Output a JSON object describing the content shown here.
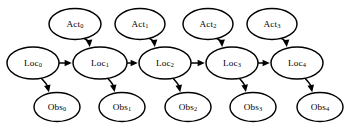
{
  "diagram": {
    "background_color": "#ffffff",
    "stroke_color": "#000000",
    "node_fill": "#ffffff",
    "nodes": {
      "act": [
        {
          "id": "act0",
          "base": "Act",
          "sub": "0",
          "cx": 75,
          "cy": 24,
          "rx": 26,
          "ry": 15.5
        },
        {
          "id": "act1",
          "base": "Act",
          "sub": "1",
          "cx": 140,
          "cy": 24,
          "rx": 25,
          "ry": 15.5
        },
        {
          "id": "act2",
          "base": "Act",
          "sub": "2",
          "cx": 208,
          "cy": 24,
          "rx": 25,
          "ry": 15.5
        },
        {
          "id": "act3",
          "base": "Act",
          "sub": "3",
          "cx": 272,
          "cy": 24,
          "rx": 25,
          "ry": 15.5
        }
      ],
      "loc": [
        {
          "id": "loc0",
          "base": "Loc",
          "sub": "0",
          "cx": 33,
          "cy": 63,
          "rx": 26,
          "ry": 16
        },
        {
          "id": "loc1",
          "base": "Loc",
          "sub": "1",
          "cx": 100,
          "cy": 63,
          "rx": 27,
          "ry": 16
        },
        {
          "id": "loc2",
          "base": "Loc",
          "sub": "2",
          "cx": 165,
          "cy": 63,
          "rx": 26,
          "ry": 16
        },
        {
          "id": "loc3",
          "base": "Loc",
          "sub": "3",
          "cx": 232,
          "cy": 63,
          "rx": 26,
          "ry": 16
        },
        {
          "id": "loc4",
          "base": "Loc",
          "sub": "4",
          "cx": 297,
          "cy": 63,
          "rx": 26,
          "ry": 16
        }
      ],
      "obs": [
        {
          "id": "obs0",
          "base": "Obs",
          "sub": "0",
          "cx": 57,
          "cy": 107,
          "rx": 23,
          "ry": 14.5
        },
        {
          "id": "obs1",
          "base": "Obs",
          "sub": "1",
          "cx": 122,
          "cy": 107,
          "rx": 23,
          "ry": 14.5
        },
        {
          "id": "obs2",
          "base": "Obs",
          "sub": "2",
          "cx": 188,
          "cy": 107,
          "rx": 23,
          "ry": 14.5
        },
        {
          "id": "obs3",
          "base": "Obs",
          "sub": "3",
          "cx": 253,
          "cy": 107,
          "rx": 23,
          "ry": 14.5
        },
        {
          "id": "obs4",
          "base": "Obs",
          "sub": "4",
          "cx": 320,
          "cy": 107,
          "rx": 23,
          "ry": 14.5
        }
      ]
    },
    "edges": [
      {
        "from": "loc0",
        "to": "loc1",
        "kind": "chain"
      },
      {
        "from": "loc1",
        "to": "loc2",
        "kind": "chain"
      },
      {
        "from": "loc2",
        "to": "loc3",
        "kind": "chain"
      },
      {
        "from": "loc3",
        "to": "loc4",
        "kind": "chain"
      },
      {
        "from": "act0",
        "to": "loc1",
        "kind": "action"
      },
      {
        "from": "act1",
        "to": "loc2",
        "kind": "action"
      },
      {
        "from": "act2",
        "to": "loc3",
        "kind": "action"
      },
      {
        "from": "act3",
        "to": "loc4",
        "kind": "action"
      },
      {
        "from": "loc0",
        "to": "obs0",
        "kind": "observation"
      },
      {
        "from": "loc1",
        "to": "obs1",
        "kind": "observation"
      },
      {
        "from": "loc2",
        "to": "obs2",
        "kind": "observation"
      },
      {
        "from": "loc3",
        "to": "obs3",
        "kind": "observation"
      },
      {
        "from": "loc4",
        "to": "obs4",
        "kind": "observation"
      }
    ]
  }
}
